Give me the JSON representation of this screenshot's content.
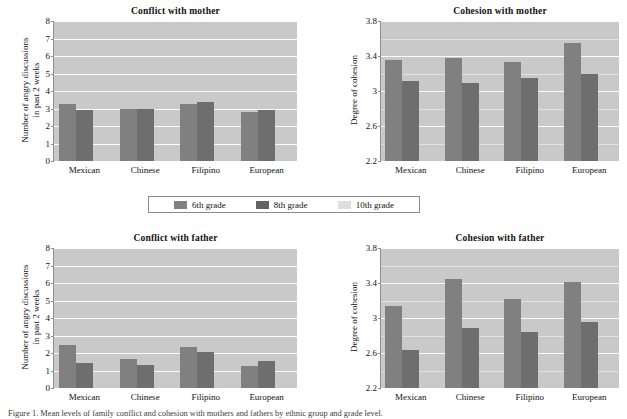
{
  "figure": {
    "caption": "Figure 1. Mean levels of family conflict and cohesion with mothers and fathers by ethnic group and grade level."
  },
  "legend": {
    "position": "center-between-rows",
    "items": [
      {
        "label": "6th grade",
        "color": "#808080",
        "icon": "legend-swatch"
      },
      {
        "label": "8th grade",
        "color": "#636363",
        "icon": "legend-swatch"
      },
      {
        "label": "10th grade",
        "color": "#dedede",
        "icon": "legend-swatch"
      }
    ]
  },
  "chart_data": [
    {
      "id": "conflict-with-mother",
      "type": "bar",
      "title": "Conflict with mother",
      "xlabel": "",
      "ylabel": "Number of angry discussions\nin past 2 weeks",
      "ylabel_lines": [
        "Number of angry discussions",
        "in past 2 weeks"
      ],
      "categories": [
        "Mexican",
        "Chinese",
        "Filipino",
        "European"
      ],
      "ylim": [
        0,
        8
      ],
      "yticks": [
        0,
        1,
        2,
        3,
        4,
        5,
        6,
        7,
        8
      ],
      "grid": true,
      "legend": [
        "6th grade",
        "8th grade",
        "10th grade"
      ],
      "series": [
        {
          "name": "6th grade",
          "values": [
            3.28,
            2.95,
            3.25,
            2.8
          ]
        },
        {
          "name": "8th grade",
          "values": [
            2.92,
            2.95,
            3.38,
            2.93
          ]
        },
        {
          "name": "10th grade",
          "values": [
            0.0,
            0.0,
            0.0,
            0.0
          ]
        }
      ]
    },
    {
      "id": "cohesion-with-mother",
      "type": "bar",
      "title": "Cohesion with mother",
      "xlabel": "",
      "ylabel": "Degree of cohesion",
      "ylabel_lines": [
        "Degree of cohesion"
      ],
      "categories": [
        "Mexican",
        "Chinese",
        "Filipino",
        "European"
      ],
      "ylim": [
        2.2,
        3.8
      ],
      "yticks": [
        2.2,
        2.6,
        3.0,
        3.4,
        3.8
      ],
      "grid": true,
      "legend": [
        "6th grade",
        "8th grade",
        "10th grade"
      ],
      "series": [
        {
          "name": "6th grade",
          "values": [
            3.35,
            3.38,
            3.33,
            3.55
          ]
        },
        {
          "name": "8th grade",
          "values": [
            3.11,
            3.09,
            3.15,
            3.19
          ]
        },
        {
          "name": "10th grade",
          "values": [
            2.2,
            2.2,
            2.2,
            2.2
          ]
        }
      ]
    },
    {
      "id": "conflict-with-father",
      "type": "bar",
      "title": "Conflict with father",
      "xlabel": "",
      "ylabel": "Number of angry discussions\nin past 2 weeks",
      "ylabel_lines": [
        "Number of angry discussions",
        "in past 2 weeks"
      ],
      "categories": [
        "Mexican",
        "Chinese",
        "Filipino",
        "European"
      ],
      "ylim": [
        0,
        8
      ],
      "yticks": [
        0,
        1,
        2,
        3,
        4,
        5,
        6,
        7,
        8
      ],
      "grid": true,
      "legend": [
        "6th grade",
        "8th grade",
        "10th grade"
      ],
      "series": [
        {
          "name": "6th grade",
          "values": [
            2.45,
            1.66,
            2.35,
            1.24
          ]
        },
        {
          "name": "8th grade",
          "values": [
            1.44,
            1.3,
            2.06,
            1.55
          ]
        },
        {
          "name": "10th grade",
          "values": [
            0.0,
            0.0,
            0.0,
            0.0
          ]
        }
      ]
    },
    {
      "id": "cohesion-with-father",
      "type": "bar",
      "title": "Cohesion with father",
      "xlabel": "",
      "ylabel": "Degree of cohesion",
      "ylabel_lines": [
        "Degree of cohesion"
      ],
      "categories": [
        "Mexican",
        "Chinese",
        "Filipino",
        "European"
      ],
      "ylim": [
        2.2,
        3.8
      ],
      "yticks": [
        2.2,
        2.6,
        3.0,
        3.4,
        3.8
      ],
      "grid": true,
      "legend": [
        "6th grade",
        "8th grade",
        "10th grade"
      ],
      "series": [
        {
          "name": "6th grade",
          "values": [
            3.14,
            3.45,
            3.22,
            3.41
          ]
        },
        {
          "name": "8th grade",
          "values": [
            2.63,
            2.89,
            2.84,
            2.96
          ]
        },
        {
          "name": "10th grade",
          "values": [
            2.2,
            2.2,
            2.2,
            2.2
          ]
        }
      ]
    }
  ]
}
